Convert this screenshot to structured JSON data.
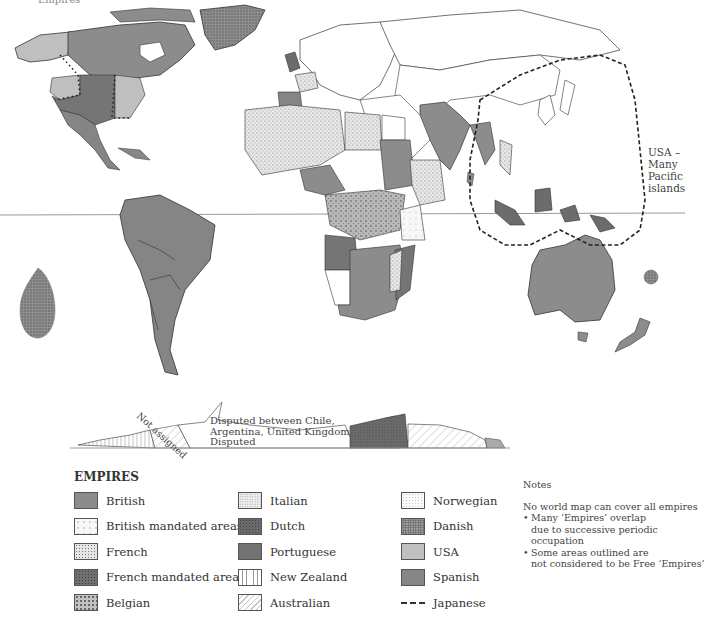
{
  "map": {
    "title_partial": "Empires",
    "equator_visible": true,
    "annotations": {
      "usa_pacific": [
        "USA –",
        "Many Pacific",
        "islands"
      ],
      "antarctica_not_assigned": "Not assigned",
      "antarctica_disputed_1": "Disputed between Chile,",
      "antarctica_disputed_2": "Argentina, United Kingdom",
      "antarctica_disputed_3": "Disputed"
    }
  },
  "legend": {
    "title": "EMPIRES",
    "items": [
      {
        "label": "British",
        "pattern": "solid",
        "color": "#8c8c8c"
      },
      {
        "label": "British mandated areas",
        "pattern": "sparse-dots",
        "color": "#f4f4f4"
      },
      {
        "label": "French",
        "pattern": "dense-dots",
        "color": "#dcdcdc"
      },
      {
        "label": "French mandated areas",
        "pattern": "dark-dots",
        "color": "#6e6e6e"
      },
      {
        "label": "Belgian",
        "pattern": "medium-dots",
        "color": "#bdbdbd"
      },
      {
        "label": "Italian",
        "pattern": "fine-dots",
        "color": "#e6e6e6"
      },
      {
        "label": "Dutch",
        "pattern": "dark-texture",
        "color": "#6a6a6a"
      },
      {
        "label": "Portuguese",
        "pattern": "solid-dark",
        "color": "#757575"
      },
      {
        "label": "New Zealand",
        "pattern": "vertical-lines",
        "color": "#ffffff"
      },
      {
        "label": "Australian",
        "pattern": "diagonal-lines",
        "color": "#ffffff"
      },
      {
        "label": "Norwegian",
        "pattern": "light-texture",
        "color": "#f6f6f6"
      },
      {
        "label": "Danish",
        "pattern": "speckle",
        "color": "#9a9a9a"
      },
      {
        "label": "USA",
        "pattern": "solid-light",
        "color": "#bfbfbf"
      },
      {
        "label": "Spanish",
        "pattern": "solid-mid",
        "color": "#858585"
      },
      {
        "label": "Japanese",
        "pattern": "dashed-line",
        "color": "#333333"
      }
    ]
  },
  "notes": {
    "title": "Notes",
    "intro": "No world map can cover all empires",
    "bullets": [
      [
        "Many ‘Empires’ overlap",
        "due to successive periodic occupation"
      ],
      [
        "Some areas outlined are",
        "not considered to be Free ‘Empires’"
      ]
    ]
  }
}
